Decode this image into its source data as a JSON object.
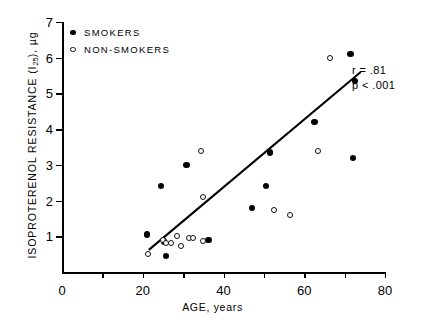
{
  "chart_data": {
    "type": "scatter",
    "title": "",
    "xlabel": "AGE, years",
    "ylabel": "ISOPROTERENOL RESISTANCE (I25), µg",
    "ylabel_main": "ISOPROTERENOL RESISTANCE (I",
    "ylabel_sub": "25",
    "ylabel_tail": "), µg",
    "xlim": [
      0,
      80
    ],
    "ylim": [
      0,
      7
    ],
    "grid": false,
    "xticks": [
      0,
      10,
      20,
      30,
      40,
      50,
      60,
      70,
      80
    ],
    "xticklabels": [
      "0",
      "",
      "20",
      "",
      "40",
      "",
      "60",
      "",
      "80"
    ],
    "yticks": [
      1,
      2,
      3,
      4,
      5,
      6,
      7
    ],
    "yticklabels": [
      "1",
      "2",
      "3",
      "4",
      "5",
      "6",
      "7"
    ],
    "legend_position": "top-left",
    "series": [
      {
        "name": "SMOKERS",
        "marker": "filled-circle",
        "color": "#000000",
        "points": [
          {
            "x": 21.0,
            "y": 1.05
          },
          {
            "x": 24.5,
            "y": 2.4
          },
          {
            "x": 25.3,
            "y": 0.85
          },
          {
            "x": 25.8,
            "y": 0.45
          },
          {
            "x": 30.8,
            "y": 3.0
          },
          {
            "x": 36.3,
            "y": 0.9
          },
          {
            "x": 47.0,
            "y": 1.8
          },
          {
            "x": 50.5,
            "y": 2.4
          },
          {
            "x": 51.5,
            "y": 3.35
          },
          {
            "x": 62.5,
            "y": 4.2
          },
          {
            "x": 71.5,
            "y": 6.1
          },
          {
            "x": 72.5,
            "y": 5.35
          },
          {
            "x": 72.0,
            "y": 3.2
          }
        ]
      },
      {
        "name": "NON-SMOKERS",
        "marker": "open-circle",
        "color": "#000000",
        "points": [
          {
            "x": 21.2,
            "y": 0.5
          },
          {
            "x": 25.0,
            "y": 0.9
          },
          {
            "x": 25.8,
            "y": 0.82
          },
          {
            "x": 27.0,
            "y": 0.8
          },
          {
            "x": 28.5,
            "y": 1.0
          },
          {
            "x": 29.5,
            "y": 0.72
          },
          {
            "x": 31.5,
            "y": 0.95
          },
          {
            "x": 32.5,
            "y": 0.95
          },
          {
            "x": 34.5,
            "y": 3.4
          },
          {
            "x": 34.8,
            "y": 2.1
          },
          {
            "x": 35.0,
            "y": 0.88
          },
          {
            "x": 52.5,
            "y": 1.75
          },
          {
            "x": 56.5,
            "y": 1.6
          },
          {
            "x": 63.5,
            "y": 3.4
          },
          {
            "x": 66.5,
            "y": 6.0
          }
        ]
      }
    ],
    "fit_line": {
      "name": "regression-line",
      "x_start": 21.5,
      "y_start": 0.62,
      "x_end": 74.0,
      "y_end": 5.6
    },
    "annotations": {
      "r_value": "r = .81",
      "p_value": "p < .001"
    }
  },
  "caption": {
    "cutoff_text": ""
  }
}
